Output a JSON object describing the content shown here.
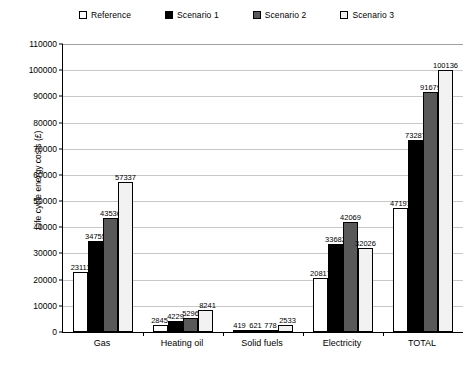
{
  "chart_data": {
    "type": "bar",
    "title": "",
    "xlabel": "",
    "ylabel": "Life cycle energy costs (£)",
    "ylim": [
      0,
      110000
    ],
    "ytick_step": 10000,
    "yticks": [
      "110000",
      "100000",
      "90000",
      "80000",
      "70000",
      "60000",
      "50000",
      "40000",
      "30000",
      "20000",
      "10000",
      "0"
    ],
    "grid": true,
    "legend_position": "top",
    "categories": [
      "Gas",
      "Heating oil",
      "Solid fuels",
      "Electricity",
      "TOTAL"
    ],
    "series": [
      {
        "name": "Reference",
        "color": "#ffffff",
        "values": [
          23111,
          2845,
          419,
          20817,
          47191
        ]
      },
      {
        "name": "Scenario 1",
        "color": "#000000",
        "values": [
          34755,
          4229,
          621,
          33682,
          73287
        ]
      },
      {
        "name": "Scenario 2",
        "color": "#595959",
        "values": [
          43536,
          5296,
          778,
          42069,
          91679
        ]
      },
      {
        "name": "Scenario 3",
        "color": "#f2f2f2",
        "values": [
          57337,
          8241,
          2533,
          32026,
          100136
        ]
      }
    ]
  },
  "legend": {
    "items": [
      {
        "label": "Reference"
      },
      {
        "label": "Scenario 1"
      },
      {
        "label": "Scenario 2"
      },
      {
        "label": "Scenario 3"
      }
    ]
  },
  "axis": {
    "y_title": "Life cycle energy costs (£)"
  }
}
